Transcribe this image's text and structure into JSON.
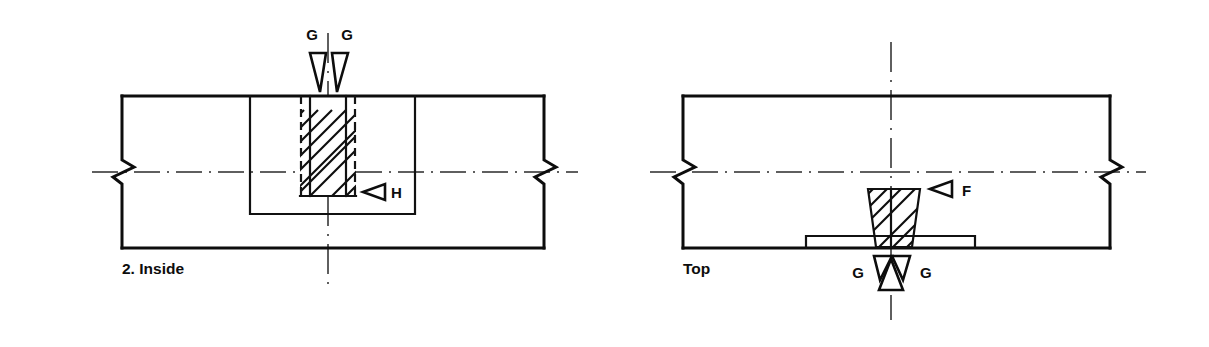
{
  "figure": {
    "type": "engineering-drawing",
    "background_color": "#ffffff",
    "line_color": "#0d0d0d"
  },
  "views": [
    {
      "id": "inside-view",
      "caption": "2.  Inside",
      "caption_number": "2.",
      "caption_name": "Inside",
      "arrow_labels": [
        {
          "name": "g-left",
          "text": "G",
          "direction": "down"
        },
        {
          "name": "g-right",
          "text": "G",
          "direction": "down"
        },
        {
          "name": "h",
          "text": "H",
          "direction": "left"
        }
      ]
    },
    {
      "id": "top-view",
      "caption": "Top",
      "caption_name": "Top",
      "arrow_labels": [
        {
          "name": "f",
          "text": "F",
          "direction": "left"
        },
        {
          "name": "g-left",
          "text": "G",
          "direction": "right"
        },
        {
          "name": "g-right",
          "text": "G",
          "direction": "left"
        }
      ]
    }
  ],
  "labels": {
    "g": "G",
    "h": "H",
    "f": "F",
    "inside_number": "2.",
    "inside_name": "Inside",
    "inside_full": "2.  Inside",
    "top": "Top"
  },
  "annotations": {
    "hatching": "45-degree section hatching",
    "break_lines": "conventional break (zigzag) symbols on both side edges of each view",
    "center_lines": "horizontal and vertical center lines (dash-dot)"
  }
}
